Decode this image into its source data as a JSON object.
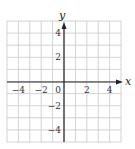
{
  "chart_data": {
    "type": "scatter",
    "title": "",
    "xlabel": "x",
    "ylabel": "y",
    "xlim": [
      -5,
      5
    ],
    "ylim": [
      -5,
      5
    ],
    "grid": true,
    "grid_step": 1,
    "x_ticks": [
      -4,
      -2,
      0,
      2,
      4
    ],
    "y_ticks": [
      4,
      2,
      -2,
      -4
    ],
    "x_tick_labels": [
      "−4",
      "−2",
      "0",
      "2",
      "4"
    ],
    "y_tick_labels": [
      "4",
      "2",
      "−2",
      "−4"
    ],
    "series": [],
    "legend": null
  },
  "colors": {
    "grid": "#c8c8c8",
    "axis": "#222222",
    "text": "#333333"
  }
}
